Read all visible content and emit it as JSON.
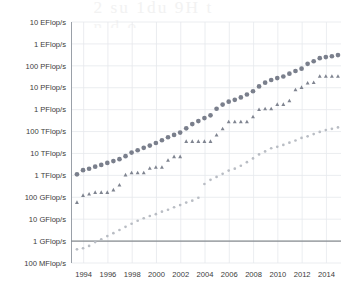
{
  "page": {
    "ghost_text_line1": "2 su  1du    9H  t",
    "ghost_text_line2": "n      d     o"
  },
  "colors": {
    "sum_series": "#7a7f8c",
    "first_series": "#7f8490",
    "last_series": "#b9bdc4",
    "gridline": "#e6e8ec",
    "axis": "#9aa0a8",
    "baseline": "#6d7278",
    "tick_text": "#3b3b3b"
  },
  "chart_data": {
    "type": "scatter",
    "title": "",
    "subtitle": "",
    "xlabel": "",
    "ylabel": "",
    "grid": true,
    "legend_position": "none",
    "x_axis": {
      "ticks": [
        1994,
        1996,
        1998,
        2000,
        2002,
        2004,
        2006,
        2008,
        2010,
        2012,
        2014
      ],
      "tick_labels": [
        "1994",
        "1996",
        "1998",
        "2000",
        "2002",
        "2004",
        "2006",
        "2008",
        "2010",
        "2012",
        "2014"
      ],
      "range": [
        1993.0,
        2015.2
      ]
    },
    "y_axis": {
      "scale": "log",
      "unit": "Flop/s",
      "tick_labels": [
        "10 EFlop/s",
        "1 EFlop/s",
        "100 PFlop/s",
        "10 PFlop/s",
        "1 PFlop/s",
        "100 TFlop/s",
        "10 TFlop/s",
        "1 TFlop/s",
        "100 GFlop/s",
        "10 GFlop/s",
        "1 GFlop/s",
        "100 MFlop/s"
      ],
      "tick_exponents": [
        19,
        18,
        17,
        16,
        15,
        14,
        13,
        12,
        11,
        10,
        9,
        8
      ],
      "range_exponents": [
        8,
        19
      ]
    },
    "series": [
      {
        "name": "Sum",
        "marker": "circle",
        "marker_size": "large",
        "color": "#7a7f8c",
        "points": [
          {
            "x": 1993.45,
            "y": 1120000000000.0
          },
          {
            "x": 1993.95,
            "y": 1730000000000.0
          },
          {
            "x": 1994.45,
            "y": 2000000000000.0
          },
          {
            "x": 1994.95,
            "y": 2500000000000.0
          },
          {
            "x": 1995.45,
            "y": 3000000000000.0
          },
          {
            "x": 1995.95,
            "y": 3700000000000.0
          },
          {
            "x": 1996.45,
            "y": 4500000000000.0
          },
          {
            "x": 1996.95,
            "y": 5500000000000.0
          },
          {
            "x": 1997.45,
            "y": 7500000000000.0
          },
          {
            "x": 1997.95,
            "y": 11000000000000.0
          },
          {
            "x": 1998.45,
            "y": 14000000000000.0
          },
          {
            "x": 1998.95,
            "y": 18000000000000.0
          },
          {
            "x": 1999.45,
            "y": 23000000000000.0
          },
          {
            "x": 1999.95,
            "y": 30000000000000.0
          },
          {
            "x": 2000.45,
            "y": 40000000000000.0
          },
          {
            "x": 2000.95,
            "y": 55000000000000.0
          },
          {
            "x": 2001.45,
            "y": 70000000000000.0
          },
          {
            "x": 2001.95,
            "y": 90000000000000.0
          },
          {
            "x": 2002.45,
            "y": 140000000000000.0
          },
          {
            "x": 2002.95,
            "y": 220000000000000.0
          },
          {
            "x": 2003.45,
            "y": 300000000000000.0
          },
          {
            "x": 2003.95,
            "y": 410000000000000.0
          },
          {
            "x": 2004.45,
            "y": 550000000000000.0
          },
          {
            "x": 2004.95,
            "y": 1100000000000000.0
          },
          {
            "x": 2005.45,
            "y": 1700000000000000.0
          },
          {
            "x": 2005.95,
            "y": 2300000000000000.0
          },
          {
            "x": 2006.45,
            "y": 2800000000000000.0
          },
          {
            "x": 2006.95,
            "y": 3600000000000000.0
          },
          {
            "x": 2007.45,
            "y": 4900000000000000.0
          },
          {
            "x": 2007.95,
            "y": 6900000000000000.0
          },
          {
            "x": 2008.45,
            "y": 1.15e+16
          },
          {
            "x": 2008.95,
            "y": 1.7e+16
          },
          {
            "x": 2009.45,
            "y": 2.25e+16
          },
          {
            "x": 2009.95,
            "y": 2.75e+16
          },
          {
            "x": 2010.45,
            "y": 3.25e+16
          },
          {
            "x": 2010.95,
            "y": 4.4e+16
          },
          {
            "x": 2011.45,
            "y": 5.8e+16
          },
          {
            "x": 2011.95,
            "y": 7.4e+16
          },
          {
            "x": 2012.45,
            "y": 1.23e+17
          },
          {
            "x": 2012.95,
            "y": 1.62e+17
          },
          {
            "x": 2013.45,
            "y": 2.23e+17
          },
          {
            "x": 2013.95,
            "y": 2.5e+17
          },
          {
            "x": 2014.45,
            "y": 2.74e+17
          },
          {
            "x": 2014.95,
            "y": 3.09e+17
          }
        ]
      },
      {
        "name": "#1",
        "marker": "triangle",
        "marker_size": "small",
        "color": "#7f8490",
        "points": [
          {
            "x": 1993.45,
            "y": 59000000000.0
          },
          {
            "x": 1993.95,
            "y": 124000000000.0
          },
          {
            "x": 1994.45,
            "y": 143000000000.0
          },
          {
            "x": 1994.95,
            "y": 170000000000.0
          },
          {
            "x": 1995.45,
            "y": 170000000000.0
          },
          {
            "x": 1995.95,
            "y": 170000000000.0
          },
          {
            "x": 1996.45,
            "y": 220000000000.0
          },
          {
            "x": 1996.95,
            "y": 368000000000.0
          },
          {
            "x": 1997.45,
            "y": 1070000000000.0
          },
          {
            "x": 1997.95,
            "y": 1340000000000.0
          },
          {
            "x": 1998.45,
            "y": 1340000000000.0
          },
          {
            "x": 1998.95,
            "y": 1340000000000.0
          },
          {
            "x": 1999.45,
            "y": 2120000000000.0
          },
          {
            "x": 1999.95,
            "y": 2380000000000.0
          },
          {
            "x": 2000.45,
            "y": 2380000000000.0
          },
          {
            "x": 2000.95,
            "y": 4940000000000.0
          },
          {
            "x": 2001.45,
            "y": 7230000000000.0
          },
          {
            "x": 2001.95,
            "y": 7230000000000.0
          },
          {
            "x": 2002.45,
            "y": 35900000000000.0
          },
          {
            "x": 2002.95,
            "y": 35900000000000.0
          },
          {
            "x": 2003.45,
            "y": 35900000000000.0
          },
          {
            "x": 2003.95,
            "y": 35900000000000.0
          },
          {
            "x": 2004.45,
            "y": 35900000000000.0
          },
          {
            "x": 2004.95,
            "y": 70700000000000.0
          },
          {
            "x": 2005.45,
            "y": 136000000000000.0
          },
          {
            "x": 2005.95,
            "y": 281000000000000.0
          },
          {
            "x": 2006.45,
            "y": 281000000000000.0
          },
          {
            "x": 2006.95,
            "y": 281000000000000.0
          },
          {
            "x": 2007.45,
            "y": 281000000000000.0
          },
          {
            "x": 2007.95,
            "y": 478000000000000.0
          },
          {
            "x": 2008.45,
            "y": 1030000000000000.0
          },
          {
            "x": 2008.95,
            "y": 1110000000000000.0
          },
          {
            "x": 2009.45,
            "y": 1110000000000000.0
          },
          {
            "x": 2009.95,
            "y": 1760000000000000.0
          },
          {
            "x": 2010.45,
            "y": 1760000000000000.0
          },
          {
            "x": 2010.95,
            "y": 2570000000000000.0
          },
          {
            "x": 2011.45,
            "y": 8160000000000000.0
          },
          {
            "x": 2011.95,
            "y": 1.05e+16
          },
          {
            "x": 2012.45,
            "y": 1.65e+16
          },
          {
            "x": 2012.95,
            "y": 1.76e+16
          },
          {
            "x": 2013.45,
            "y": 3.39e+16
          },
          {
            "x": 2013.95,
            "y": 3.39e+16
          },
          {
            "x": 2014.45,
            "y": 3.39e+16
          },
          {
            "x": 2014.95,
            "y": 3.39e+16
          }
        ]
      },
      {
        "name": "#500",
        "marker": "circle",
        "marker_size": "tiny",
        "color": "#b9bdc4",
        "points": [
          {
            "x": 1993.45,
            "y": 422000000.0
          },
          {
            "x": 1993.95,
            "y": 470000000.0
          },
          {
            "x": 1994.45,
            "y": 600000000.0
          },
          {
            "x": 1994.95,
            "y": 900000000.0
          },
          {
            "x": 1995.45,
            "y": 1200000000.0
          },
          {
            "x": 1995.95,
            "y": 1700000000.0
          },
          {
            "x": 1996.45,
            "y": 2300000000.0
          },
          {
            "x": 1996.95,
            "y": 3200000000.0
          },
          {
            "x": 1997.45,
            "y": 4500000000.0
          },
          {
            "x": 1997.95,
            "y": 6200000000.0
          },
          {
            "x": 1998.45,
            "y": 8500000000.0
          },
          {
            "x": 1998.95,
            "y": 11000000000.0
          },
          {
            "x": 1999.45,
            "y": 14000000000.0
          },
          {
            "x": 1999.95,
            "y": 17000000000.0
          },
          {
            "x": 2000.45,
            "y": 22000000000.0
          },
          {
            "x": 2000.95,
            "y": 27000000000.0
          },
          {
            "x": 2001.45,
            "y": 35000000000.0
          },
          {
            "x": 2001.95,
            "y": 44000000000.0
          },
          {
            "x": 2002.45,
            "y": 57000000000.0
          },
          {
            "x": 2002.95,
            "y": 70000000000.0
          },
          {
            "x": 2003.45,
            "y": 95000000000.0
          },
          {
            "x": 2003.95,
            "y": 403000000000.0
          },
          {
            "x": 2004.45,
            "y": 624000000000.0
          },
          {
            "x": 2004.95,
            "y": 850000000000.0
          },
          {
            "x": 2005.45,
            "y": 1170000000000.0
          },
          {
            "x": 2005.95,
            "y": 1650000000000.0
          },
          {
            "x": 2006.45,
            "y": 2030000000000.0
          },
          {
            "x": 2006.95,
            "y": 2740000000000.0
          },
          {
            "x": 2007.45,
            "y": 4000000000000.0
          },
          {
            "x": 2007.95,
            "y": 5900000000000.0
          },
          {
            "x": 2008.45,
            "y": 9000000000000.0
          },
          {
            "x": 2008.95,
            "y": 12400000000000.0
          },
          {
            "x": 2009.45,
            "y": 17300000000000.0
          },
          {
            "x": 2009.95,
            "y": 20100000000000.0
          },
          {
            "x": 2010.45,
            "y": 24400000000000.0
          },
          {
            "x": 2010.95,
            "y": 31100000000000.0
          },
          {
            "x": 2011.45,
            "y": 39000000000000.0
          },
          {
            "x": 2011.95,
            "y": 50900000000000.0
          },
          {
            "x": 2012.45,
            "y": 60800000000000.0
          },
          {
            "x": 2012.95,
            "y": 76500000000000.0
          },
          {
            "x": 2013.45,
            "y": 96500000000000.0
          },
          {
            "x": 2013.95,
            "y": 117000000000000.0
          },
          {
            "x": 2014.45,
            "y": 133000000000000.0
          },
          {
            "x": 2014.95,
            "y": 154000000000000.0
          }
        ]
      }
    ]
  }
}
